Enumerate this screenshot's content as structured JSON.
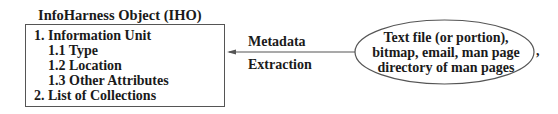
{
  "diagram": {
    "object_box": {
      "title": "InfoHarness Object (IHO)",
      "items": [
        {
          "label": "1. Information Unit",
          "indent": 0
        },
        {
          "label": "1.1 Type",
          "indent": 1
        },
        {
          "label": "1.2 Location",
          "indent": 1
        },
        {
          "label": "1.3 Other Attributes",
          "indent": 1
        },
        {
          "label": "2. List of Collections",
          "indent": 0
        }
      ]
    },
    "arrow": {
      "label_top": "Metadata",
      "label_bottom": "Extraction",
      "direction": "right-to-left"
    },
    "source_ellipse": {
      "lines": [
        "Text file (or portion),",
        "bitmap, email, man page",
        "directory of man pages"
      ],
      "trailing_mark": ","
    },
    "colors": {
      "stroke": "#555555",
      "text": "#1a1a1a",
      "background": "#ffffff"
    }
  }
}
